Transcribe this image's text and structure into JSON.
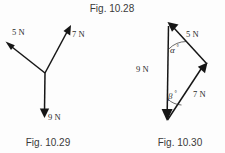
{
  "figure": {
    "title": "Fig. 10.28",
    "background_color": "#fdfdfd",
    "ink_color": "#161616"
  },
  "diagrams": [
    {
      "id": "concurrent-forces",
      "caption": "Fig. 10.29",
      "type": "concurrent-force-diagram",
      "origin": {
        "x": 45,
        "y": 73
      },
      "vectors": [
        {
          "name": "five-newton",
          "label": "5 N",
          "tip": {
            "x": 6,
            "y": 42
          },
          "label_pos": {
            "x": 12,
            "y": 35
          }
        },
        {
          "name": "seven-newton",
          "label": "7 N",
          "tip": {
            "x": 71,
            "y": 26
          },
          "label_pos": {
            "x": 73,
            "y": 37
          }
        },
        {
          "name": "nine-newton",
          "label": "9 N",
          "tip": {
            "x": 44,
            "y": 117
          },
          "label_pos": {
            "x": 48,
            "y": 120
          }
        }
      ]
    },
    {
      "id": "force-triangle",
      "caption": "Fig. 10.30",
      "type": "vector-triangle-diagram",
      "vertices": {
        "top": {
          "x": 168,
          "y": 24
        },
        "right": {
          "x": 207,
          "y": 64
        },
        "bottom": {
          "x": 167,
          "y": 121
        }
      },
      "vectors": [
        {
          "name": "nine-newton",
          "label": "9 N",
          "label_pos": {
            "x": 136,
            "y": 72
          }
        },
        {
          "name": "five-newton",
          "label": "5 N",
          "label_pos": {
            "x": 186,
            "y": 37
          }
        },
        {
          "name": "seven-newton",
          "label": "7 N",
          "label_pos": {
            "x": 193,
            "y": 97
          }
        }
      ],
      "angles": [
        {
          "name": "alpha",
          "symbol": "α",
          "degree_mark": "°",
          "label_pos": {
            "x": 170,
            "y": 52
          }
        },
        {
          "name": "beta",
          "symbol": "β",
          "degree_mark": "°",
          "label_pos": {
            "x": 169,
            "y": 98
          }
        }
      ]
    }
  ]
}
